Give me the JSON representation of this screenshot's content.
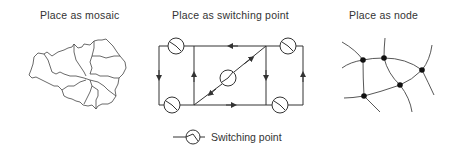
{
  "panels": [
    {
      "title": "Place as mosaic",
      "kind": "mosaic"
    },
    {
      "title": "Place as switching point",
      "kind": "switching-network"
    },
    {
      "title": "Place as node",
      "kind": "node-network"
    }
  ],
  "legend": {
    "symbol": "switching-point-icon",
    "label": "Switching point"
  },
  "colors": {
    "stroke": "#333333",
    "background": "#ffffff"
  }
}
